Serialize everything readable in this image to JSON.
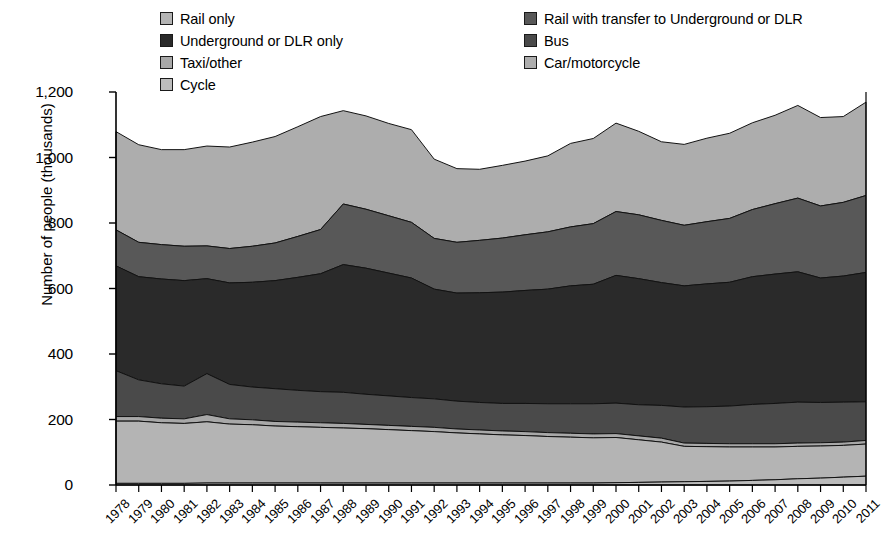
{
  "legend": {
    "columns": [
      {
        "items": [
          {
            "label": "Rail only",
            "color": "#b4b4b4",
            "name": "legend-rail-only"
          },
          {
            "label": "Underground or DLR only",
            "color": "#2a2a2a",
            "name": "legend-underground-dlr-only"
          },
          {
            "label": "Taxi/other",
            "color": "#a8a8a8",
            "name": "legend-taxi-other"
          },
          {
            "label": "Cycle",
            "color": "#bcbcbc",
            "name": "legend-cycle"
          }
        ]
      },
      {
        "items": [
          {
            "label": "Rail with transfer to Underground or DLR",
            "color": "#585858",
            "name": "legend-rail-with-transfer"
          },
          {
            "label": "Bus",
            "color": "#4a4a4a",
            "name": "legend-bus"
          },
          {
            "label": "Car/motorcycle",
            "color": "#adadad",
            "name": "legend-car-motorcycle"
          }
        ]
      }
    ]
  },
  "axes": {
    "ylabel": "Number of people (thousands)",
    "yticks": [
      "0",
      "200",
      "400",
      "600",
      "800",
      "1,000",
      "1,200"
    ],
    "ytick_values": [
      0,
      200,
      400,
      600,
      800,
      1000,
      1200
    ],
    "ylim": [
      0,
      1200
    ],
    "xticks": [
      "1978",
      "1979",
      "1980",
      "1981",
      "1982",
      "1983",
      "1984",
      "1985",
      "1986",
      "1987",
      "1988",
      "1989",
      "1990",
      "1991",
      "1992",
      "1993",
      "1994",
      "1995",
      "1996",
      "1997",
      "1998",
      "1999",
      "2000",
      "2001",
      "2002",
      "2003",
      "2004",
      "2005",
      "2006",
      "2007",
      "2008",
      "2009",
      "2010",
      "2011"
    ]
  },
  "chart_data": {
    "type": "area",
    "stacked": true,
    "title": "",
    "xlabel": "",
    "ylabel": "Number of people (thousands)",
    "ylim": [
      0,
      1200
    ],
    "grid": false,
    "legend_position": "top",
    "x": [
      1978,
      1979,
      1980,
      1981,
      1982,
      1983,
      1984,
      1985,
      1986,
      1987,
      1988,
      1989,
      1990,
      1991,
      1992,
      1993,
      1994,
      1995,
      1996,
      1997,
      1998,
      1999,
      2000,
      2001,
      2002,
      2003,
      2004,
      2005,
      2006,
      2007,
      2008,
      2009,
      2010,
      2011
    ],
    "series": [
      {
        "name": "Cycle",
        "color": "#bcbcbc",
        "order": 1,
        "values": [
          5,
          5,
          5,
          5,
          6,
          6,
          6,
          6,
          6,
          6,
          6,
          6,
          6,
          6,
          6,
          6,
          6,
          6,
          6,
          6,
          6,
          6,
          7,
          8,
          9,
          10,
          11,
          12,
          14,
          16,
          19,
          21,
          24,
          27
        ]
      },
      {
        "name": "Rail only",
        "color": "#b4b4b4",
        "order": 2,
        "values": [
          190,
          190,
          185,
          183,
          187,
          180,
          178,
          174,
          172,
          170,
          168,
          166,
          163,
          160,
          157,
          153,
          150,
          147,
          145,
          142,
          140,
          138,
          138,
          130,
          122,
          108,
          106,
          104,
          102,
          100,
          99,
          98,
          97,
          98
        ]
      },
      {
        "name": "Taxi/other",
        "color": "#a8a8a8",
        "order": 3,
        "values": [
          14,
          14,
          14,
          14,
          22,
          16,
          15,
          14,
          14,
          14,
          14,
          13,
          13,
          13,
          13,
          12,
          12,
          12,
          12,
          12,
          12,
          12,
          12,
          12,
          12,
          10,
          10,
          10,
          10,
          10,
          10,
          10,
          10,
          11
        ]
      },
      {
        "name": "Bus",
        "color": "#4a4a4a",
        "order": 4,
        "values": [
          140,
          112,
          105,
          100,
          125,
          105,
          100,
          100,
          97,
          95,
          95,
          92,
          90,
          88,
          87,
          85,
          84,
          84,
          86,
          88,
          90,
          92,
          93,
          95,
          100,
          110,
          112,
          115,
          120,
          123,
          125,
          123,
          122,
          118
        ]
      },
      {
        "name": "Underground or DLR only",
        "color": "#2a2a2a",
        "order": 5,
        "values": [
          320,
          315,
          320,
          322,
          290,
          310,
          320,
          330,
          345,
          360,
          390,
          385,
          375,
          365,
          335,
          330,
          335,
          340,
          345,
          350,
          360,
          365,
          390,
          385,
          375,
          370,
          375,
          378,
          390,
          395,
          398,
          380,
          385,
          395
        ]
      },
      {
        "name": "Rail with transfer to Underground or DLR",
        "color": "#585858",
        "order": 6,
        "values": [
          110,
          105,
          105,
          105,
          100,
          105,
          110,
          115,
          125,
          135,
          185,
          180,
          175,
          170,
          155,
          155,
          160,
          165,
          170,
          175,
          180,
          185,
          195,
          195,
          190,
          185,
          190,
          195,
          205,
          215,
          225,
          220,
          225,
          235
        ]
      },
      {
        "name": "Car/motorcycle",
        "color": "#adadad",
        "order": 7,
        "values": [
          300,
          298,
          290,
          295,
          305,
          310,
          318,
          325,
          335,
          345,
          285,
          285,
          282,
          283,
          242,
          225,
          217,
          222,
          225,
          232,
          255,
          260,
          270,
          255,
          240,
          247,
          255,
          260,
          265,
          270,
          283,
          270,
          262,
          285
        ]
      }
    ],
    "totals": [
      1079,
      1039,
      1024,
      1024,
      1035,
      1032,
      1047,
      1064,
      1094,
      1125,
      1143,
      1127,
      1104,
      1085,
      995,
      966,
      964,
      976,
      989,
      995,
      1043,
      1058,
      1105,
      1080,
      1048,
      1030,
      1059,
      1074,
      1106,
      1129,
      1159,
      1122,
      1125,
      1169
    ]
  }
}
